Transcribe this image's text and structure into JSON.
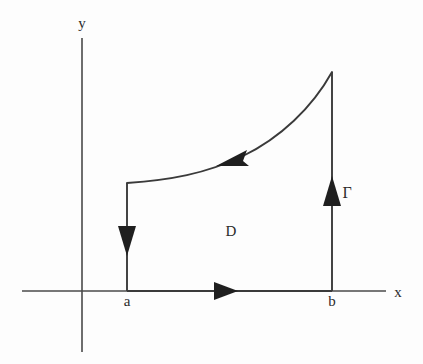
{
  "figure": {
    "background_color": "#fdfdfd",
    "stroke_color": "#3a3a3a",
    "label_color": "#2b2b2b"
  },
  "axes": {
    "x_axis": {
      "label": "x",
      "label_x": 398,
      "label_y": 297,
      "y": 291,
      "x_start": 22,
      "x_end": 386
    },
    "y_axis": {
      "label": "y",
      "label_x": 82,
      "label_y": 28,
      "x": 82,
      "y_start": 38,
      "y_end": 352
    }
  },
  "ticks": [
    {
      "name": "a",
      "label": "a",
      "x": 127,
      "label_x": 127,
      "label_y": 306
    },
    {
      "name": "b",
      "label": "b",
      "x": 332,
      "label_x": 332,
      "label_y": 306
    }
  ],
  "labels": {
    "region": {
      "text": "D",
      "x": 231,
      "y": 236
    },
    "contour": {
      "text": "Γ",
      "x": 347,
      "y": 198
    }
  },
  "contour": {
    "name": "Gamma",
    "left_vertical": {
      "x": 127,
      "y_top": 183,
      "y_bottom": 291,
      "direction": "down"
    },
    "right_vertical": {
      "x": 332,
      "y_top": 72,
      "y_bottom": 291,
      "direction": "up"
    },
    "bottom_segment": {
      "y": 291,
      "x_left": 127,
      "x_right": 332,
      "direction": "right"
    },
    "top_curve": {
      "path": "M 127 183 C 170 180, 205 174, 243 156 C 280 138, 312 108, 332 72",
      "direction": "leftward",
      "start_point": [
        332,
        72
      ],
      "end_point": [
        127,
        183
      ]
    }
  },
  "arrows": [
    {
      "name": "x-axis-arrow",
      "direction": "right",
      "x": 225,
      "y": 291
    },
    {
      "name": "left-edge-arrow",
      "direction": "down",
      "x": 127,
      "y": 241
    },
    {
      "name": "right-edge-arrow",
      "direction": "up",
      "x": 332,
      "y": 191
    },
    {
      "name": "curve-arrow",
      "direction": "left-down",
      "x": 232,
      "y": 162
    }
  ]
}
